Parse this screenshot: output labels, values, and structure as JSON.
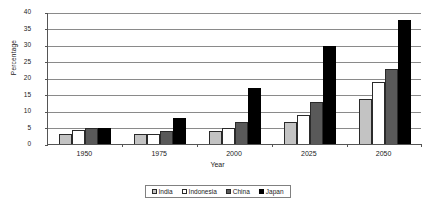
{
  "chart_data": {
    "type": "bar",
    "title": "",
    "xlabel": "Year",
    "ylabel": "Percentage",
    "categories": [
      "1950",
      "1975",
      "2000",
      "2025",
      "2050"
    ],
    "series": [
      {
        "name": "India",
        "color": "#c3c3c3",
        "values": [
          3.1,
          3.0,
          3.9,
          6.7,
          13.7
        ]
      },
      {
        "name": "Indonesia",
        "color": "#ffffff",
        "values": [
          4.1,
          3.0,
          4.9,
          8.7,
          18.8
        ]
      },
      {
        "name": "China",
        "color": "#595959",
        "values": [
          5.0,
          4.0,
          6.8,
          12.8,
          22.6
        ]
      },
      {
        "name": "Japan",
        "color": "#000000",
        "values": [
          4.9,
          7.9,
          16.9,
          29.6,
          37.5
        ]
      }
    ],
    "ylim": [
      0,
      40
    ],
    "ytick_step": 5,
    "yticks": [
      "40",
      "35",
      "30",
      "25",
      "20",
      "15",
      "10",
      "5",
      "0"
    ],
    "grid": true,
    "legend_position": "bottom",
    "legend_entries": [
      "India",
      "Indonesia",
      "China",
      "Japan"
    ]
  }
}
